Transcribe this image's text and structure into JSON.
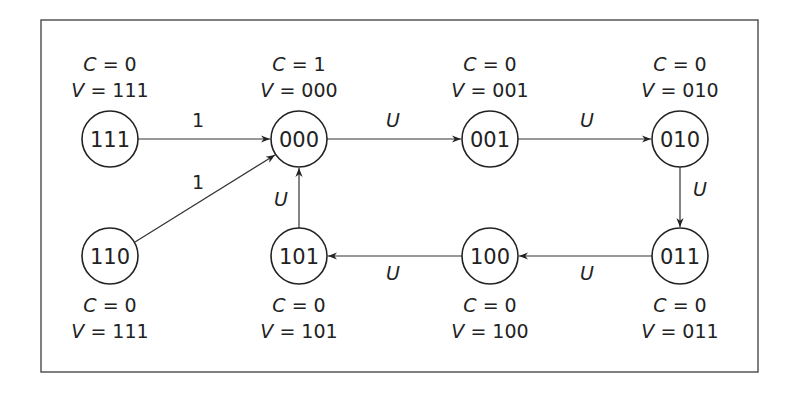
{
  "diagram": {
    "type": "state-transition-graph",
    "nodes": [
      {
        "id": "111a",
        "label": "111",
        "C": "0",
        "V": "111",
        "x": 110,
        "y": 139,
        "annot_pos": "above"
      },
      {
        "id": "000",
        "label": "000",
        "C": "1",
        "V": "000",
        "x": 299,
        "y": 139,
        "annot_pos": "above"
      },
      {
        "id": "001",
        "label": "001",
        "C": "0",
        "V": "001",
        "x": 490,
        "y": 139,
        "annot_pos": "above"
      },
      {
        "id": "010",
        "label": "010",
        "C": "0",
        "V": "010",
        "x": 680,
        "y": 139,
        "annot_pos": "above"
      },
      {
        "id": "110",
        "label": "110",
        "C": "0",
        "V": "111",
        "x": 110,
        "y": 256,
        "annot_pos": "below"
      },
      {
        "id": "101",
        "label": "101",
        "C": "0",
        "V": "101",
        "x": 299,
        "y": 256,
        "annot_pos": "below"
      },
      {
        "id": "100",
        "label": "100",
        "C": "0",
        "V": "100",
        "x": 490,
        "y": 256,
        "annot_pos": "below"
      },
      {
        "id": "011",
        "label": "011",
        "C": "0",
        "V": "011",
        "x": 680,
        "y": 256,
        "annot_pos": "below"
      }
    ],
    "edges": [
      {
        "from": "111a",
        "to": "000",
        "label": "1"
      },
      {
        "from": "110",
        "to": "000",
        "label": "1"
      },
      {
        "from": "000",
        "to": "001",
        "label": "U"
      },
      {
        "from": "001",
        "to": "010",
        "label": "U"
      },
      {
        "from": "010",
        "to": "011",
        "label": "U"
      },
      {
        "from": "011",
        "to": "100",
        "label": "U"
      },
      {
        "from": "100",
        "to": "101",
        "label": "U"
      },
      {
        "from": "101",
        "to": "000",
        "label": "U"
      }
    ],
    "annotation_prefix": {
      "c": "C",
      "v": "V",
      "eq": " = "
    }
  }
}
